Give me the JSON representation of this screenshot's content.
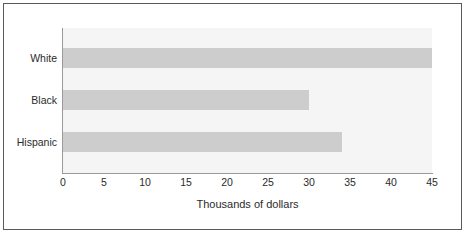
{
  "chart_data": {
    "type": "bar",
    "orientation": "horizontal",
    "title": "",
    "categories": [
      "White",
      "Black",
      "Hispanic"
    ],
    "values": [
      45,
      30,
      34
    ],
    "series": [
      {
        "name": "Median income",
        "values": [
          45,
          30,
          34
        ]
      }
    ],
    "xlabel": "Thousands of dollars",
    "ylabel": "",
    "xlim": [
      0,
      45
    ],
    "xticks": [
      0,
      5,
      10,
      15,
      20,
      25,
      30,
      35,
      40,
      45
    ],
    "xticklabels": [
      "0",
      "5",
      "10",
      "15",
      "20",
      "25",
      "30",
      "35",
      "40",
      "45"
    ],
    "grid": false,
    "legend": false,
    "bar_color": "#cdcdcd",
    "bar_shadow_color": "#a8a8a8",
    "plot_background": "#f5f5f5",
    "axis_color": "#9a9a9a",
    "border_color": "#5a5a5a",
    "text_color": "#2b2b2b"
  }
}
